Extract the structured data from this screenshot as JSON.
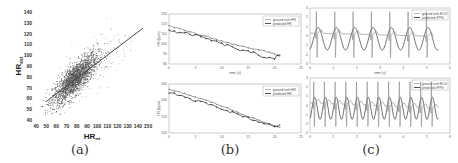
{
  "captions": {
    "a": "(a)",
    "b": "(b)",
    "c": "(c)"
  },
  "chart_data": [
    {
      "id": "a",
      "type": "scatter",
      "title": "",
      "xlabel": "HR_gt",
      "ylabel": "HR_est",
      "xlabel_main": "HR",
      "xlabel_sub": "gt",
      "ylabel_main": "HR",
      "ylabel_sub": "est",
      "xlim": [
        40,
        150
      ],
      "ylim": [
        40,
        140
      ],
      "xticks": [
        40,
        50,
        60,
        70,
        80,
        90,
        100,
        110,
        120,
        130,
        140,
        150
      ],
      "yticks": [
        40,
        50,
        60,
        70,
        80,
        90,
        100,
        110,
        120,
        130,
        140
      ],
      "fit_line": {
        "x": [
          50,
          145
        ],
        "y": [
          57,
          125
        ]
      },
      "point_cloud": {
        "center": [
          78,
          78
        ],
        "description": "dense cluster of ~2000 points along the diagonal, spread roughly 55-130"
      },
      "grid": false
    },
    {
      "id": "b-top",
      "type": "line",
      "xlabel": "time (s)",
      "ylabel": "HR (bpm)",
      "xlim": [
        0,
        25
      ],
      "ylim": [
        80,
        130
      ],
      "xticks": [
        0,
        5,
        10,
        15,
        20,
        25
      ],
      "yticks": [
        80,
        90,
        100,
        110,
        120,
        130
      ],
      "legend": [
        "ground truth HR",
        "predicted HR"
      ],
      "legend_position": "upper right",
      "series": [
        {
          "name": "ground truth HR",
          "x": [
            0,
            2,
            4,
            6,
            8,
            10,
            12,
            14,
            16,
            18,
            20,
            21
          ],
          "values": [
            118,
            115,
            112,
            109,
            106,
            103,
            100,
            98,
            95,
            93,
            90,
            88
          ]
        },
        {
          "name": "predicted HR",
          "x": [
            0,
            2,
            4,
            6,
            8,
            10,
            12,
            14,
            16,
            18,
            20,
            21
          ],
          "values": [
            114,
            111,
            110,
            107,
            104,
            100,
            97,
            93,
            91,
            87,
            86,
            89
          ]
        }
      ]
    },
    {
      "id": "b-bottom",
      "type": "line",
      "xlabel": "time (s)",
      "ylabel": "HR (bpm)",
      "xlim": [
        0,
        25
      ],
      "ylim": [
        100,
        160
      ],
      "xticks": [
        0,
        5,
        10,
        15,
        20,
        25
      ],
      "yticks": [
        100,
        120,
        140,
        160
      ],
      "legend": [
        "ground truth HR",
        "predicted HR"
      ],
      "legend_position": "upper right",
      "series": [
        {
          "name": "ground truth HR",
          "x": [
            0,
            2,
            4,
            6,
            8,
            10,
            12,
            14,
            16,
            18,
            20,
            21
          ],
          "values": [
            153,
            150,
            146,
            142,
            138,
            133,
            128,
            123,
            118,
            113,
            109,
            107
          ]
        },
        {
          "name": "predicted HR",
          "x": [
            0,
            2,
            4,
            6,
            8,
            10,
            12,
            14,
            16,
            18,
            20,
            21
          ],
          "values": [
            150,
            146,
            141,
            138,
            135,
            130,
            125,
            121,
            116,
            112,
            108,
            110
          ]
        }
      ]
    },
    {
      "id": "c-top",
      "type": "line",
      "xlabel": "time (s)",
      "ylabel": "",
      "xlim": [
        0,
        6
      ],
      "ylim": [
        -3,
        3
      ],
      "xticks": [
        0,
        1,
        2,
        3,
        4,
        5,
        6
      ],
      "yticks": [
        -3,
        -2,
        -1,
        0,
        1,
        2,
        3
      ],
      "legend": [
        "ground truth ECG",
        "predicted rPPG"
      ],
      "legend_position": "upper right",
      "series": [
        {
          "name": "ground truth ECG",
          "description": "sharp R-peak spikes, ~7 beats over 5.5 s"
        },
        {
          "name": "predicted rPPG",
          "description": "smooth sinusoid with ~7 cycles, amplitude ~1.2"
        }
      ]
    },
    {
      "id": "c-bottom",
      "type": "line",
      "xlabel": "time (s)",
      "ylabel": "",
      "xlim": [
        0,
        6
      ],
      "ylim": [
        -3,
        3
      ],
      "xticks": [
        0,
        1,
        2,
        3,
        4,
        5,
        6
      ],
      "yticks": [
        -3,
        -2,
        -1,
        0,
        1,
        2,
        3
      ],
      "legend": [
        "ground truth ECG",
        "predicted rPPG"
      ],
      "legend_position": "upper right",
      "series": [
        {
          "name": "ground truth ECG",
          "description": "sharp R-peak spikes, ~12 beats over 5.5 s"
        },
        {
          "name": "predicted rPPG",
          "description": "smooth sinusoid with ~12 cycles, amplitude ~1"
        }
      ]
    }
  ]
}
